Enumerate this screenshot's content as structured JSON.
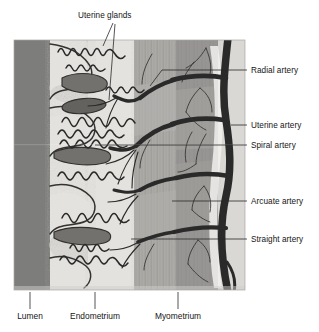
{
  "figure": {
    "panel": {
      "x": 14,
      "y": 40,
      "width": 231,
      "height": 250,
      "border_color": "#9a9a9a"
    },
    "colors": {
      "lumen": "#7b7b7b",
      "endometrium_functional": "#e2e0dc",
      "endometrium_basal": "#d8d6d2",
      "myometrium_inner": "#a9a7a3",
      "myometrium_outer": "#8e8c88",
      "vessel_dark": "#232323",
      "gland_fill": "#6e6c68",
      "background": "#ffffff",
      "leader_line": "#2a2a2a",
      "text": "#151515"
    }
  },
  "labels": {
    "top": [
      {
        "id": "uterine-glands",
        "text": "Uterine glands",
        "text_x": 78,
        "text_y": 18,
        "anchor": "start",
        "leader": "M 115 22 L 104 44 M 115 22 L 109 95"
      }
    ],
    "right": [
      {
        "id": "radial-artery",
        "text": "Radial artery",
        "text_x": 250,
        "text_y": 73,
        "anchor": "start",
        "leader": "M 246 70 L 160 70 L 148 86"
      },
      {
        "id": "uterine-artery",
        "text": "Uterine artery",
        "text_x": 250,
        "text_y": 128,
        "anchor": "start",
        "leader": "M 246 125 L 228 125"
      },
      {
        "id": "spiral-artery",
        "text": "Spiral artery",
        "text_x": 250,
        "text_y": 148,
        "anchor": "start",
        "leader": "M 246 145 L 95 145"
      },
      {
        "id": "arcuate-artery",
        "text": "Arcuate artery",
        "text_x": 250,
        "text_y": 204,
        "anchor": "start",
        "leader": "M 246 201 L 172 201"
      },
      {
        "id": "straight-artery",
        "text": "Straight artery",
        "text_x": 250,
        "text_y": 242,
        "anchor": "start",
        "leader": "M 246 239 L 188 239 M 188 239 L 130 239"
      }
    ],
    "bottom": [
      {
        "id": "lumen",
        "text": "Lumen",
        "text_x": 30,
        "text_y": 318,
        "anchor": "middle",
        "leader": "M 30 292 L 30 308"
      },
      {
        "id": "endometrium",
        "text": "Endometrium",
        "text_x": 95,
        "text_y": 318,
        "anchor": "middle",
        "leader": "M 95 292 L 95 308"
      },
      {
        "id": "myometrium",
        "text": "Myometrium",
        "text_x": 178,
        "text_y": 318,
        "anchor": "middle",
        "leader": "M 178 292 L 178 308"
      }
    ]
  },
  "anatomy": {
    "layers": [
      {
        "name": "Lumen",
        "x_start": 14,
        "x_end": 48
      },
      {
        "name": "Endometrium",
        "x_start": 48,
        "x_end": 135
      },
      {
        "name": "Myometrium",
        "x_start": 135,
        "x_end": 245
      }
    ],
    "vessels": [
      {
        "name": "Uterine artery",
        "orientation": "vertical",
        "description": "thick trunk at lateral margin"
      },
      {
        "name": "Arcuate artery",
        "orientation": "horizontal",
        "description": "branches running into myometrium"
      },
      {
        "name": "Radial artery",
        "orientation": "horizontal",
        "description": "penetrating myometrium toward endometrium"
      },
      {
        "name": "Spiral artery",
        "orientation": "coiled",
        "description": "coiled arterioles in functional layer"
      },
      {
        "name": "Straight artery",
        "orientation": "short",
        "description": "supplies basal layer"
      }
    ],
    "gland_count": 3,
    "spiral_artery_count": 7
  }
}
